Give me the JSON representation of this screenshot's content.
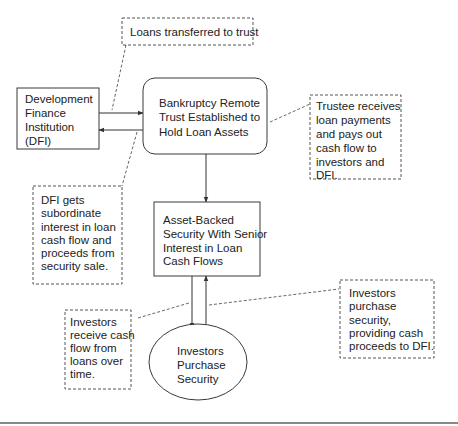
{
  "diagram": {
    "nodes": {
      "dfi": {
        "lines": [
          "Development",
          "Finance",
          "Institution",
          "(DFI)"
        ]
      },
      "trust": {
        "lines": [
          "Bankruptcy Remote",
          "Trust Established to",
          "Hold Loan Assets"
        ]
      },
      "abs": {
        "lines": [
          "Asset-Backed",
          "Security With Senior",
          "Interest in Loan",
          "Cash Flows"
        ]
      },
      "investors": {
        "lines": [
          "Investors",
          "Purchase",
          "Security"
        ]
      }
    },
    "notes": {
      "loans_transferred": {
        "lines": [
          "Loans transferred to trust"
        ]
      },
      "trustee": {
        "lines": [
          "Trustee receives",
          "loan payments",
          "and pays out",
          "cash flow to",
          "investors and",
          "DFI."
        ]
      },
      "dfi_subordinate": {
        "lines": [
          "DFI gets",
          "subordinate",
          "interest in loan",
          "cash flow and",
          "proceeds from",
          "security sale."
        ]
      },
      "investors_receive": {
        "lines": [
          "Investors",
          "receive cash",
          "flow from",
          "loans over",
          "time."
        ]
      },
      "investors_purchase": {
        "lines": [
          "Investors",
          "purchase",
          "security,",
          "providing cash",
          "proceeds to DFI."
        ]
      }
    }
  }
}
